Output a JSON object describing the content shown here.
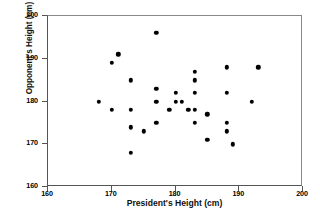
{
  "chart_data": {
    "type": "scatter",
    "title": "",
    "xlabel": "President's Height (cm)",
    "ylabel": "Opponent's Height (cm)",
    "xlim": [
      160,
      200
    ],
    "ylim": [
      160,
      200
    ],
    "xticks": [
      160,
      170,
      180,
      190,
      200
    ],
    "yticks": [
      160,
      170,
      180,
      190,
      200
    ],
    "xtick_labels": [
      "160",
      "170",
      "180",
      "190",
      "200"
    ],
    "ytick_labels": [
      "160",
      "170",
      "180",
      "190",
      "200"
    ],
    "grid": false,
    "legend": false,
    "marker": "filled-circle",
    "marker_color": "#000000",
    "series": [
      {
        "name": "President vs Opponent height",
        "points": [
          [
            168,
            180
          ],
          [
            170,
            189
          ],
          [
            170,
            178
          ],
          [
            171,
            191
          ],
          [
            173,
            185
          ],
          [
            173,
            178
          ],
          [
            173,
            174
          ],
          [
            173,
            168
          ],
          [
            175,
            173
          ],
          [
            177,
            196
          ],
          [
            177,
            183
          ],
          [
            177,
            180
          ],
          [
            177,
            175
          ],
          [
            179,
            178
          ],
          [
            180,
            182
          ],
          [
            180,
            180
          ],
          [
            181,
            180
          ],
          [
            182,
            178
          ],
          [
            183,
            187
          ],
          [
            183,
            185
          ],
          [
            183,
            182
          ],
          [
            183,
            178
          ],
          [
            183,
            175
          ],
          [
            185,
            177
          ],
          [
            185,
            171
          ],
          [
            188,
            188
          ],
          [
            188,
            182
          ],
          [
            188,
            175
          ],
          [
            188,
            173
          ],
          [
            189,
            170
          ],
          [
            192,
            180
          ],
          [
            193,
            188
          ]
        ]
      }
    ]
  }
}
